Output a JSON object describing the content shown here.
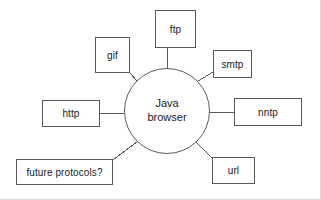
{
  "diagram": {
    "type": "hub-and-spoke",
    "canvas": {
      "width": 321,
      "height": 200,
      "background": "#ffffff"
    },
    "stroke_color": "#595959",
    "text_color": "#1a1a1a",
    "hub": {
      "id": "java-browser",
      "label_line_1": "Java",
      "label_line_2": "browser",
      "shape": "circle",
      "cx": 167,
      "cy": 111,
      "r": 43
    },
    "nodes": [
      {
        "id": "ftp",
        "label": "ftp",
        "x": 155,
        "y": 10,
        "w": 41,
        "h": 38
      },
      {
        "id": "gif",
        "label": "gif",
        "x": 95,
        "y": 37,
        "w": 35,
        "h": 36
      },
      {
        "id": "smtp",
        "label": "smtp",
        "x": 213,
        "y": 50,
        "w": 39,
        "h": 28
      },
      {
        "id": "http",
        "label": "http",
        "x": 42,
        "y": 100,
        "w": 58,
        "h": 27
      },
      {
        "id": "nntp",
        "label": "nntp",
        "x": 234,
        "y": 98,
        "w": 68,
        "h": 28
      },
      {
        "id": "future-protocols",
        "label": "future protocols?",
        "x": 16,
        "y": 159,
        "w": 97,
        "h": 26
      },
      {
        "id": "url",
        "label": "url",
        "x": 212,
        "y": 157,
        "w": 43,
        "h": 27
      }
    ],
    "edges": [
      {
        "id": "edge-hub-ftp",
        "from": "java-browser",
        "to": "ftp",
        "x1": 167,
        "y1": 68,
        "x2": 167,
        "y2": 48
      },
      {
        "id": "edge-hub-gif",
        "from": "java-browser",
        "to": "gif",
        "x1": 137,
        "y1": 81,
        "x2": 130,
        "y2": 73
      },
      {
        "id": "edge-hub-smtp",
        "from": "java-browser",
        "to": "smtp",
        "x1": 198,
        "y1": 81,
        "x2": 213,
        "y2": 72
      },
      {
        "id": "edge-hub-http",
        "from": "java-browser",
        "to": "http",
        "x1": 124,
        "y1": 113,
        "x2": 100,
        "y2": 113
      },
      {
        "id": "edge-hub-nntp",
        "from": "java-browser",
        "to": "nntp",
        "x1": 210,
        "y1": 112,
        "x2": 234,
        "y2": 112
      },
      {
        "id": "edge-hub-future-protocols",
        "from": "java-browser",
        "to": "future-protocols",
        "x1": 137,
        "y1": 142,
        "x2": 113,
        "y2": 160
      },
      {
        "id": "edge-hub-url",
        "from": "java-browser",
        "to": "url",
        "x1": 196,
        "y1": 142,
        "x2": 212,
        "y2": 158
      }
    ]
  }
}
